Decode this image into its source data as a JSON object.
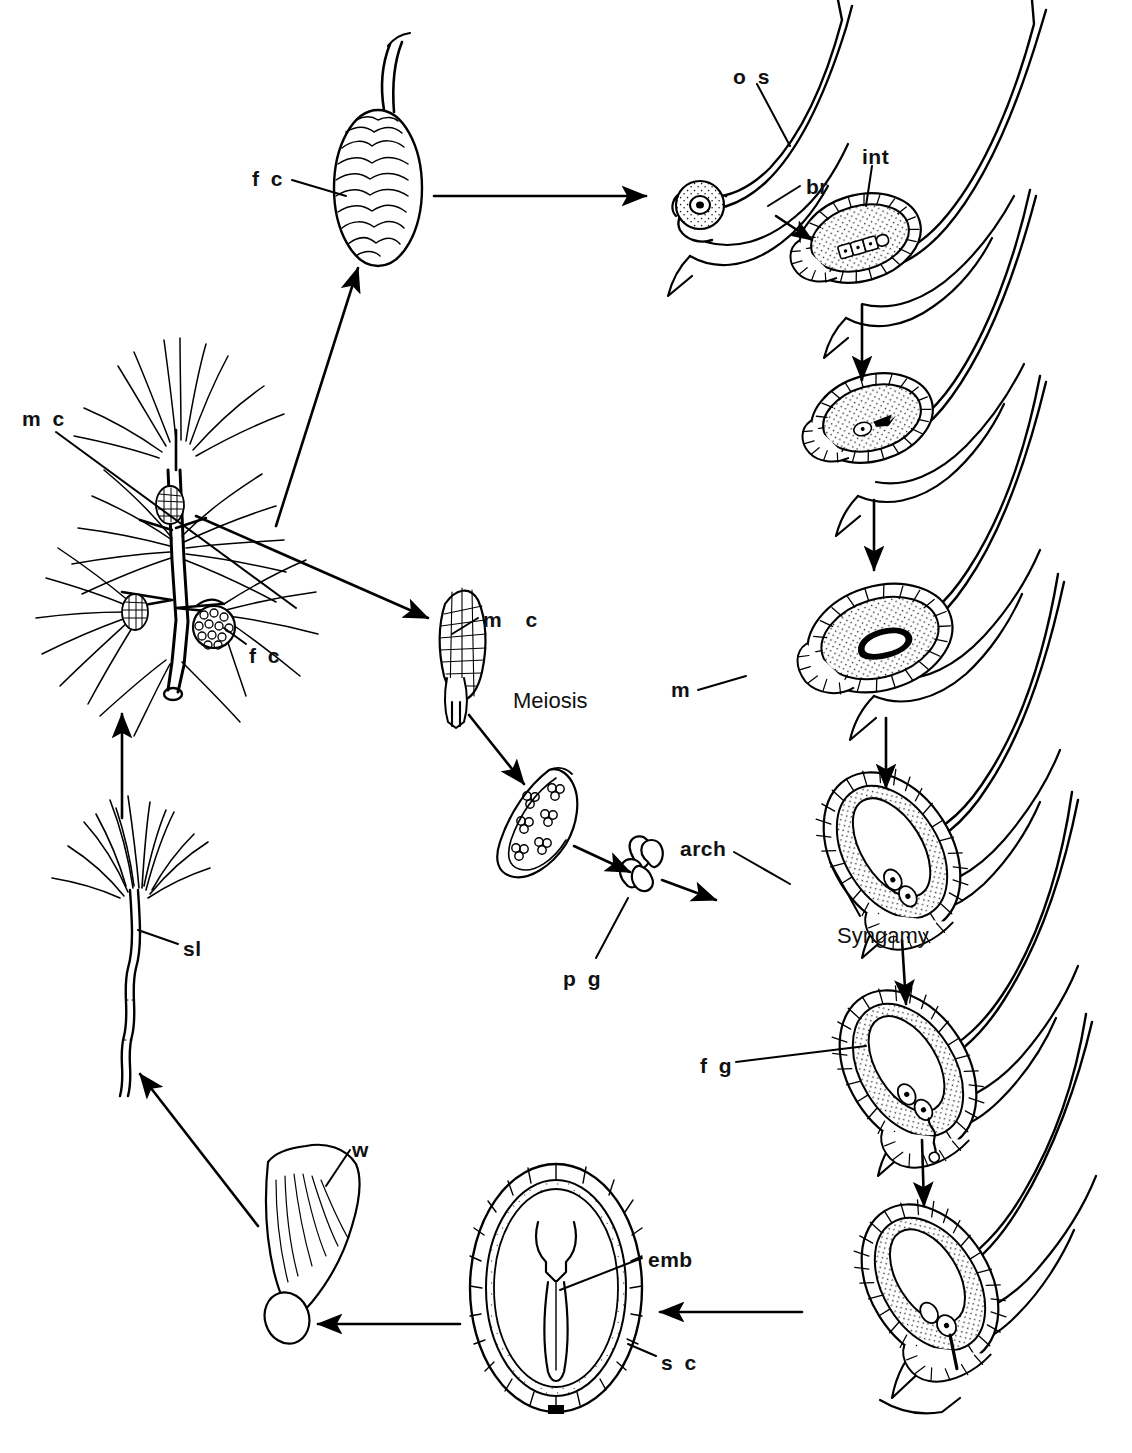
{
  "figure": {
    "type": "biological-life-cycle-diagram",
    "background_color": "#ffffff",
    "ink_color": "#000000"
  },
  "labels": {
    "female_cone_top": "f c",
    "female_cone_branch": "f c",
    "male_cone_branch": "m c",
    "male_cone_detail": "m c",
    "meiosis": "Meiosis",
    "pollen_grain": "p g",
    "ovuliferous_scale": "o s",
    "bract": "br",
    "integument": "int",
    "megaspore": "m",
    "archegonium": "arch",
    "syngamy": "Syngamy",
    "female_gametophyte": "f g",
    "embryo": "emb",
    "seed_coat": "s c",
    "wing": "w",
    "seedling": "sl"
  },
  "label_glossary": [
    {
      "abbr": "f c",
      "meaning": "female cone"
    },
    {
      "abbr": "m c",
      "meaning": "male cone"
    },
    {
      "abbr": "o s",
      "meaning": "ovuliferous scale"
    },
    {
      "abbr": "br",
      "meaning": "bract"
    },
    {
      "abbr": "int",
      "meaning": "integument"
    },
    {
      "abbr": "m",
      "meaning": "megaspore"
    },
    {
      "abbr": "arch",
      "meaning": "archegonium"
    },
    {
      "abbr": "f g",
      "meaning": "female gametophyte"
    },
    {
      "abbr": "p g",
      "meaning": "pollen grain"
    },
    {
      "abbr": "emb",
      "meaning": "embryo"
    },
    {
      "abbr": "s c",
      "meaning": "seed coat"
    },
    {
      "abbr": "w",
      "meaning": "wing"
    },
    {
      "abbr": "sl",
      "meaning": "seedling"
    }
  ],
  "stages": [
    {
      "id": "pine-branch",
      "name": "Mature pine branch with male and female cones"
    },
    {
      "id": "female-cone",
      "name": "Mature female cone"
    },
    {
      "id": "male-cone",
      "name": "Male cone"
    },
    {
      "id": "microsporangium",
      "name": "Microsporangium with microspores"
    },
    {
      "id": "pollen-grain",
      "name": "Winged pollen grain"
    },
    {
      "id": "ovule-young",
      "name": "Young ovule on ovuliferous scale"
    },
    {
      "id": "ovule-megaspore-row",
      "name": "Ovule with megaspore mother cell row"
    },
    {
      "id": "ovule-single-megaspore",
      "name": "Ovule with functional megaspore"
    },
    {
      "id": "ovule-megagametophyte",
      "name": "Ovule with enlarged megaspore"
    },
    {
      "id": "ovule-archegonia",
      "name": "Ovule with archegonia and pollen tube"
    },
    {
      "id": "ovule-syngamy",
      "name": "Ovule after syngamy, female gametophyte"
    },
    {
      "id": "ovule-embryo",
      "name": "Ovule with developing embryo"
    },
    {
      "id": "seed",
      "name": "Seed with embryo and seed coat"
    },
    {
      "id": "winged-seed",
      "name": "Winged seed"
    },
    {
      "id": "seedling",
      "name": "Pine seedling"
    }
  ],
  "label_positions": {
    "female_cone_top": {
      "x": 252,
      "y": 168
    },
    "ovuliferous_scale": {
      "x": 733,
      "y": 66
    },
    "bract": {
      "x": 806,
      "y": 176
    },
    "integument": {
      "x": 862,
      "y": 146
    },
    "male_cone_branch": {
      "x": 22,
      "y": 408
    },
    "male_cone_detail": {
      "x": 483,
      "y": 609
    },
    "female_cone_branch": {
      "x": 249,
      "y": 645
    },
    "megaspore": {
      "x": 671,
      "y": 679
    },
    "meiosis": {
      "x": 513,
      "y": 690
    },
    "archegonium": {
      "x": 680,
      "y": 838
    },
    "syngamy": {
      "x": 837,
      "y": 925
    },
    "pollen_grain": {
      "x": 563,
      "y": 968
    },
    "female_gametophyte": {
      "x": 700,
      "y": 1055
    },
    "seedling": {
      "x": 183,
      "y": 938
    },
    "wing": {
      "x": 352,
      "y": 1139
    },
    "embryo": {
      "x": 648,
      "y": 1249
    },
    "seed_coat": {
      "x": 661,
      "y": 1352
    }
  }
}
